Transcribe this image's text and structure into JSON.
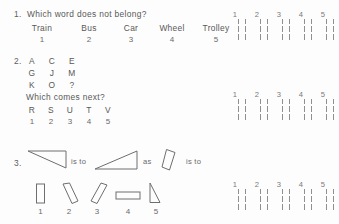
{
  "document": {
    "title": "Aptitude Test Worksheet",
    "background_color": "#fdfdfd",
    "ink_color": "#585858"
  },
  "questions": [
    {
      "number": "1.",
      "prompt": "Which word does not belong?",
      "options": [
        {
          "label": "Train",
          "number": "1"
        },
        {
          "label": "Bus",
          "number": "2"
        },
        {
          "label": "Car",
          "number": "3"
        },
        {
          "label": "Wheel",
          "number": "4"
        },
        {
          "label": "Trolley",
          "number": "5"
        }
      ],
      "answer_labels": [
        "1",
        "2",
        "3",
        "4",
        "5"
      ]
    },
    {
      "number": "2.",
      "matrix": [
        [
          "A",
          "C",
          "E"
        ],
        [
          "G",
          "J",
          "M"
        ],
        [
          "K",
          "O",
          "?"
        ]
      ],
      "prompt": "Which comes next?",
      "options": [
        {
          "label": "R",
          "number": "1"
        },
        {
          "label": "S",
          "number": "2"
        },
        {
          "label": "U",
          "number": "3"
        },
        {
          "label": "T",
          "number": "4"
        },
        {
          "label": "V",
          "number": "5"
        }
      ],
      "answer_labels": [
        "1",
        "2",
        "3",
        "4",
        "5"
      ]
    },
    {
      "number": "3.",
      "relation_1": "is to",
      "relation_2": "as",
      "relation_3": "is to",
      "figure_a": "right-triangle-flat-top",
      "figure_b": "right-triangle-flat-bottom",
      "figure_c": "tilted-rectangle-right-lean",
      "options": [
        {
          "label": "1",
          "shape": "upright-rectangle"
        },
        {
          "label": "2",
          "shape": "tilted-rectangle-left-lean"
        },
        {
          "label": "3",
          "shape": "tilted-rectangle-right-lean"
        },
        {
          "label": "4",
          "shape": "wide-rectangle"
        },
        {
          "label": "5",
          "shape": "narrow-right-triangle"
        }
      ],
      "answer_labels": [
        "1",
        "2",
        "3",
        "4",
        "5"
      ]
    }
  ]
}
